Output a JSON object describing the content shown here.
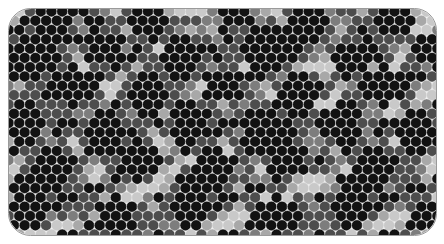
{
  "canvas": {
    "width": 444,
    "height": 244,
    "background": "#ffffff"
  },
  "panel": {
    "label": "bead-mosaic-panel",
    "x": 8.5,
    "y": 8.5,
    "width": 428,
    "height": 227,
    "corner_radius": 22,
    "fill": "#f7f7f7",
    "stroke": "#9a9a9a",
    "stroke_width": 1
  },
  "grid": {
    "type": "hexagonal-close-packed",
    "cell_radius": 5.5,
    "x_step": 10.72,
    "y_step": 9.3,
    "x_origin": 8.6,
    "y_origin": 11.4,
    "columns": 41,
    "rows": 25,
    "odd_row_offset": 5.36,
    "circle_stroke": "#e9e9e9",
    "circle_stroke_width": 0.5
  },
  "palette": {
    "names": [
      "black",
      "dark-gray",
      "mid-gray",
      "light-gray",
      "pale-gray"
    ],
    "codes": [
      "k",
      "d",
      "m",
      "l",
      "p"
    ],
    "hex": [
      "#121212",
      "#4d4d4d",
      "#7d7d7d",
      "#a8a8a8",
      "#c9c9c9"
    ]
  },
  "chart_data": {
    "type": "heatmap",
    "title": "",
    "xlabel": "",
    "ylabel": "",
    "legend": [],
    "rows": [
      "pplmldkkdlplkkdlpppmdkkmlppldkmdplpkkdlpm",
      "lkkdmlpkkdplmkkdlplpkdkmplpkkdmlppdkkmlpl",
      "kkdlpplmkdplpmkdlpplkdmlpkkdplmlpkdkmlppm",
      "dmlppkkdmlpplkdmlppmkdlplkkdmlpplkdmlpplk",
      "lplkkdmlpplmkdlpplkkdmlpplmkdlpplkkdmlppl",
      "pplmkdlpplkkdmlpplmkdlpplkkdmlpplmkdlppkk",
      "lkkdmlpplmkdlpplkkdmlpplmkdlpplkkdmlpplmk",
      "kdmlpplkkdmlpplmkdlpplkkdmlpplmkdlpplkkdm",
      "mlpplkkdmlpplmkdlpplkkdmlpplmkdlpplkkdmlp",
      "pplkkdmlpplmkdlpplkkdmlpplmkdlpplkkdmlppl",
      "lkkdmlpplmkdlpplkkdmlpplmkdlpplkkdmlpplmk",
      "pkkdplmlpkdmkplpmkdlplkkdmlpplmkdlpplkkdm",
      "mlpplkkdmlpplmkdlpplkkdmlpplmkdlpplkkdmlp",
      "pplmkdlpplkkdmlpplmkdlpplkkdmlpplmkdlppkk",
      "lkkdmlpplmkdlpplkkdmlpplmkdlpplkkdmlpplmk",
      "kdmlpplkkdmlpplmkdlpplkkdmlpplmkdlpplkkdm",
      "mlpplkkdmlpplmkdlpplkkdmlpplmkdlpplkkdmlp",
      "pplkkdmlpplmkdlpplkkdmlpplmkdlpplkkdmlppl",
      "lkkdmlpplmkdlpplkkdmlpplmkdlpplkkdmlpplmk",
      "kdmlpplkkdmlpplmkdlpplkkdmlpplmkdlpplkkdm",
      "mlpplkkdmlpplmkdlpplkkdmlpplmkdlpplkkdmlp",
      "pplmkdlpplkkdmlpplmkdlpplkkdmlpplmkdlppkk",
      "lkkdmlpplmkdlpplkkdmlpplmkdlpplkkdmlpplmk",
      "kdmlpplkkdmlpplmkdlpplkkdmlpplmkdlpplkkdm",
      "mlpplkkdmlpplmkdlpplkkdmlpplmkdlpplkkdmlp"
    ],
    "dark_clusters": [
      {
        "cx": 4,
        "cy": 1,
        "r": 2.1
      },
      {
        "cx": 13,
        "cy": 1,
        "r": 1.9
      },
      {
        "cx": 21,
        "cy": 0,
        "r": 1.7
      },
      {
        "cx": 28,
        "cy": 1,
        "r": 2.0
      },
      {
        "cx": 36,
        "cy": 1,
        "r": 1.8
      },
      {
        "cx": 2,
        "cy": 5,
        "r": 2.3
      },
      {
        "cx": 9,
        "cy": 4,
        "r": 1.8
      },
      {
        "cx": 16,
        "cy": 5,
        "r": 2.0
      },
      {
        "cx": 24,
        "cy": 4,
        "r": 2.2
      },
      {
        "cx": 32,
        "cy": 5,
        "r": 1.9
      },
      {
        "cx": 39,
        "cy": 4,
        "r": 1.7
      },
      {
        "cx": 6,
        "cy": 8,
        "r": 2.0
      },
      {
        "cx": 13,
        "cy": 9,
        "r": 2.2
      },
      {
        "cx": 20,
        "cy": 8,
        "r": 1.8
      },
      {
        "cx": 27,
        "cy": 9,
        "r": 2.1
      },
      {
        "cx": 35,
        "cy": 8,
        "r": 2.0
      },
      {
        "cx": 1,
        "cy": 12,
        "r": 2.0
      },
      {
        "cx": 9,
        "cy": 13,
        "r": 2.2
      },
      {
        "cx": 17,
        "cy": 12,
        "r": 1.9
      },
      {
        "cx": 24,
        "cy": 13,
        "r": 2.3
      },
      {
        "cx": 31,
        "cy": 12,
        "r": 1.8
      },
      {
        "cx": 38,
        "cy": 13,
        "r": 2.0
      },
      {
        "cx": 4,
        "cy": 17,
        "r": 2.2
      },
      {
        "cx": 12,
        "cy": 16,
        "r": 1.9
      },
      {
        "cx": 19,
        "cy": 17,
        "r": 2.1
      },
      {
        "cx": 26,
        "cy": 16,
        "r": 1.8
      },
      {
        "cx": 34,
        "cy": 17,
        "r": 2.2
      },
      {
        "cx": 2,
        "cy": 21,
        "r": 2.0
      },
      {
        "cx": 10,
        "cy": 22,
        "r": 1.9
      },
      {
        "cx": 17,
        "cy": 21,
        "r": 2.1
      },
      {
        "cx": 25,
        "cy": 22,
        "r": 2.0
      },
      {
        "cx": 32,
        "cy": 21,
        "r": 2.2
      },
      {
        "cx": 39,
        "cy": 22,
        "r": 1.7
      }
    ],
    "mid_clusters": [
      {
        "cx": 8,
        "cy": 2,
        "r": 2.6
      },
      {
        "cx": 18,
        "cy": 3,
        "r": 2.4
      },
      {
        "cx": 30,
        "cy": 2,
        "r": 2.8
      },
      {
        "cx": 5,
        "cy": 10,
        "r": 2.7
      },
      {
        "cx": 15,
        "cy": 7,
        "r": 2.5
      },
      {
        "cx": 22,
        "cy": 11,
        "r": 2.9
      },
      {
        "cx": 33,
        "cy": 10,
        "r": 2.6
      },
      {
        "cx": 11,
        "cy": 15,
        "r": 2.8
      },
      {
        "cx": 21,
        "cy": 18,
        "r": 2.5
      },
      {
        "cx": 29,
        "cy": 15,
        "r": 2.7
      },
      {
        "cx": 37,
        "cy": 19,
        "r": 2.4
      },
      {
        "cx": 6,
        "cy": 20,
        "r": 2.6
      },
      {
        "cx": 14,
        "cy": 23,
        "r": 2.5
      },
      {
        "cx": 27,
        "cy": 23,
        "r": 2.7
      }
    ],
    "axis_ranges": {
      "x": [
        0,
        41
      ],
      "y": [
        0,
        25
      ]
    },
    "grid_visible": false,
    "legend_position": "none"
  }
}
